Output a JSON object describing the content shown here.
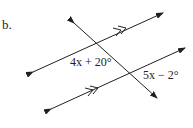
{
  "problem": {
    "part_label": "b.",
    "angle_labels": [
      {
        "id": "angle-top",
        "text": "4x + 20°",
        "expression_var": "x",
        "coefficient": 4,
        "constant": 20
      },
      {
        "id": "angle-bottom",
        "text": "5x − 2°",
        "expression_var": "x",
        "coefficient": 5,
        "constant": -2
      }
    ],
    "lines": [
      {
        "id": "parallel-line-top",
        "type": "parallel",
        "parallel_mark": "double-arrow"
      },
      {
        "id": "parallel-line-bottom",
        "type": "parallel",
        "parallel_mark": "double-arrow"
      },
      {
        "id": "transversal",
        "type": "transversal"
      }
    ],
    "color": "#231f20"
  }
}
